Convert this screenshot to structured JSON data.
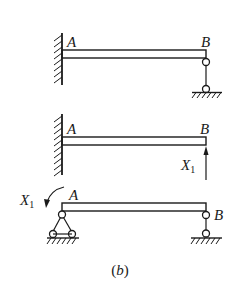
{
  "figure": {
    "caption": {
      "open": "(",
      "letter": "b",
      "close": ")"
    },
    "colors": {
      "ink": "#1a1a1a",
      "background": "#ffffff"
    },
    "panels": [
      {
        "id": "original-structure",
        "description": "Beam AB fixed at A, supported by pinned link at B",
        "labels": {
          "left": "A",
          "right": "B"
        },
        "left_support": "fixed-wall",
        "right_support": "link-bar-pinned"
      },
      {
        "id": "basic-structure-cantilever",
        "description": "Cantilever AB fixed at A with redundant force X1 at B",
        "labels": {
          "left": "A",
          "right": "B"
        },
        "left_support": "fixed-wall",
        "right_support": "none",
        "load": {
          "symbol": "X",
          "subscript": "1",
          "type": "upward-force"
        }
      },
      {
        "id": "basic-structure-simply-supported",
        "description": "Simply supported beam AB with redundant moment X1 at A",
        "labels": {
          "left": "A",
          "right": "B"
        },
        "left_support": "pin-support",
        "right_support": "roller-link",
        "load": {
          "symbol": "X",
          "subscript": "1",
          "type": "moment-counterclockwise"
        }
      }
    ]
  }
}
